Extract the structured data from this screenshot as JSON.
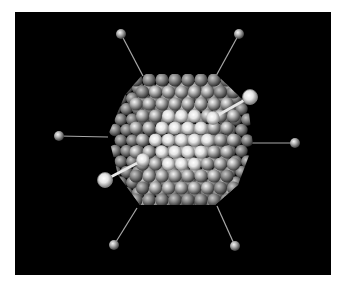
{
  "figure": {
    "background": "#000000",
    "frame": {
      "x": 15,
      "y": 12,
      "width": 316,
      "height": 263
    },
    "colors": {
      "sphere_highlight": "#ffffff",
      "sphere_mid": "#b9b9b9",
      "sphere_shadow": "#3a3a3a",
      "bond": "#a8a8a8",
      "bright_bond": "#e8e8e8"
    },
    "cluster": {
      "center": [
        180,
        140
      ],
      "outline": [
        [
          143,
          74
        ],
        [
          216,
          74
        ],
        [
          248,
          105
        ],
        [
          253,
          145
        ],
        [
          238,
          185
        ],
        [
          215,
          205
        ],
        [
          140,
          205
        ],
        [
          118,
          175
        ],
        [
          108,
          135
        ],
        [
          125,
          95
        ]
      ],
      "back_layer": {
        "origin": [
          115,
          88
        ],
        "dx": 11.5,
        "dy": 10.5,
        "cols": 12,
        "rows": 12,
        "r": 6.2
      },
      "front_layer": {
        "origin": [
          136,
          80
        ],
        "dx": 13,
        "dy": 12,
        "cols": 8,
        "rows": 11,
        "r": 6.6
      },
      "front_bright_center": [
        182,
        138
      ],
      "front_bright_radius": 58
    },
    "ligands": [
      {
        "name": "top-left",
        "anchor": [
          143,
          76
        ],
        "end": [
          121,
          34
        ],
        "r": 5,
        "bright": false
      },
      {
        "name": "top-right",
        "anchor": [
          216,
          76
        ],
        "end": [
          239,
          34
        ],
        "r": 5,
        "bright": false
      },
      {
        "name": "left",
        "anchor": [
          108,
          137
        ],
        "end": [
          59,
          136
        ],
        "r": 5,
        "bright": false
      },
      {
        "name": "right",
        "anchor": [
          252,
          143
        ],
        "end": [
          295,
          143
        ],
        "r": 5,
        "bright": false
      },
      {
        "name": "bottom-left",
        "anchor": [
          137,
          208
        ],
        "end": [
          114,
          245
        ],
        "r": 5,
        "bright": false
      },
      {
        "name": "bottom-right",
        "anchor": [
          217,
          206
        ],
        "end": [
          235,
          246
        ],
        "r": 5,
        "bright": false
      },
      {
        "name": "upper-right-large",
        "anchor": [
          213,
          118
        ],
        "end": [
          250,
          97
        ],
        "r": 7.5,
        "bright": true
      },
      {
        "name": "lower-left-large",
        "anchor": [
          143,
          160
        ],
        "end": [
          105,
          180
        ],
        "r": 7.5,
        "bright": true
      }
    ]
  }
}
